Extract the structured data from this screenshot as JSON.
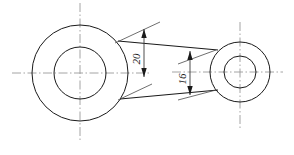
{
  "drawing": {
    "title": "connecting-rod-outline",
    "colors": {
      "outline": "#1a1a1a",
      "centerline": "#9a9a9a",
      "dimension": "#3a3a3a",
      "background": "#ffffff"
    },
    "left_boss": {
      "name": "large-end-boss",
      "center_x": 80,
      "center_y": 73,
      "outer_radius": 48,
      "inner_radius": 26
    },
    "right_boss": {
      "name": "small-end-boss",
      "center_x": 240,
      "center_y": 72,
      "outer_radius": 30,
      "inner_radius": 16
    },
    "rod": {
      "upper_start_x": 118,
      "upper_start_y": 41,
      "upper_end_x": 218,
      "upper_end_y": 50,
      "lower_start_x": 120,
      "lower_start_y": 99,
      "lower_end_x": 218,
      "lower_end_y": 90
    },
    "dimensions": [
      {
        "id": "dim-20",
        "label": "20",
        "value": 20,
        "orientation": "vertical",
        "line_x": 144,
        "top_y": 30,
        "bottom_y": 76,
        "text_x": 140,
        "text_y": 59,
        "text_rotation": -90
      },
      {
        "id": "dim-16",
        "label": "16",
        "value": 16,
        "orientation": "vertical",
        "line_x": 190,
        "top_y": 52,
        "bottom_y": 94,
        "text_x": 186,
        "text_y": 80,
        "text_rotation": -90
      }
    ],
    "centerlines": {
      "left_horizontal": {
        "x1": 12,
        "y1": 73,
        "x2": 148,
        "y2": 73
      },
      "left_vertical": {
        "x1": 80,
        "y1": 3,
        "x2": 80,
        "y2": 141
      },
      "right_horizontal": {
        "x1": 196,
        "y1": 72,
        "x2": 283,
        "y2": 72
      },
      "right_vertical": {
        "x1": 240,
        "y1": 22,
        "x2": 240,
        "y2": 130
      }
    }
  }
}
